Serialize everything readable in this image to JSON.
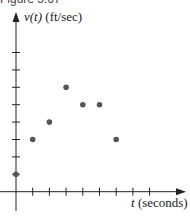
{
  "caption": "Figure 5.67",
  "chart_data": {
    "type": "scatter",
    "title": "",
    "xlabel_var": "t",
    "xlabel_unit": "(seconds)",
    "ylabel_var": "v(t)",
    "ylabel_unit": "(ft/sec)",
    "x": [
      0,
      1,
      2,
      3,
      4,
      5,
      6
    ],
    "y": [
      1,
      3,
      4,
      6,
      5,
      5,
      3
    ],
    "xlim": [
      0,
      8
    ],
    "ylim": [
      0,
      8
    ],
    "x_ticks": [
      1,
      2,
      3,
      4,
      5,
      6,
      7,
      8
    ],
    "y_ticks": [
      1,
      2,
      3,
      4,
      5,
      6,
      7,
      8
    ],
    "tick_labels_shown": false,
    "grid": false,
    "legend": null,
    "point_color": "#555555",
    "axis_color": "#222222"
  }
}
